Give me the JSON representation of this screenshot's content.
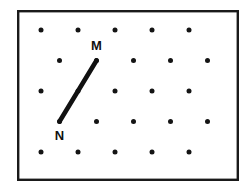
{
  "figure": {
    "background_color": "#ffffff",
    "frame": {
      "name": "outer-border",
      "x": 17,
      "y": 10,
      "width": 222,
      "height": 171,
      "stroke_color": "#1a1a1a",
      "stroke_width": 2.4
    },
    "lattice": {
      "type": "staggered-triangular",
      "dot_color": "#141414",
      "dot_radius": 2.5,
      "row_spacing": 30.5,
      "column_spacing": 37,
      "stagger_offset": 18.5,
      "rows": [
        {
          "index": 1,
          "y": 30,
          "x_positions": [
            41,
            78,
            115,
            152,
            189
          ]
        },
        {
          "index": 2,
          "y": 60.5,
          "x_positions": [
            59.5,
            96.5,
            133.5,
            170.5,
            207.5
          ]
        },
        {
          "index": 3,
          "y": 91,
          "x_positions": [
            41,
            78,
            115,
            152,
            189
          ]
        },
        {
          "index": 4,
          "y": 121.5,
          "x_positions": [
            59.5,
            96.5,
            133.5,
            170.5,
            207.5
          ]
        },
        {
          "index": 5,
          "y": 152,
          "x_positions": [
            41,
            78,
            115,
            152,
            189
          ]
        }
      ]
    },
    "segment": {
      "name": "segment-mn",
      "from": "N",
      "to": "M",
      "stroke_color": "#111111",
      "stroke_width": 4.6,
      "x1": 59.5,
      "y1": 121.5,
      "x2": 96.5,
      "y2": 60.5
    },
    "points": [
      {
        "id": "M",
        "label": "M",
        "x": 96.5,
        "y": 60.5,
        "label_x": 96.5,
        "label_y": 50,
        "label_anchor": "middle"
      },
      {
        "id": "N",
        "label": "N",
        "x": 59.5,
        "y": 121.5,
        "label_x": 59.5,
        "label_y": 140,
        "label_anchor": "middle"
      }
    ]
  }
}
